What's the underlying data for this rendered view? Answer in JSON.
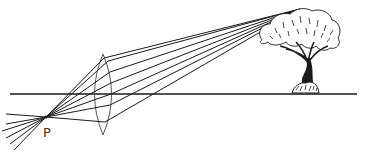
{
  "diagram": {
    "type": "optics-ray-diagram",
    "labels": {
      "focus_point": "P"
    },
    "elements": {
      "optical_axis": {
        "name": "horizontal principal axis"
      },
      "lens": {
        "name": "biconvex converging lens"
      },
      "object": {
        "name": "tree"
      },
      "rays": {
        "count": 6,
        "name": "light rays from treetop through lens converging at P"
      }
    },
    "colors": {
      "line": "#1a1a1a",
      "lens": "#555555",
      "background": "#ffffff"
    }
  }
}
